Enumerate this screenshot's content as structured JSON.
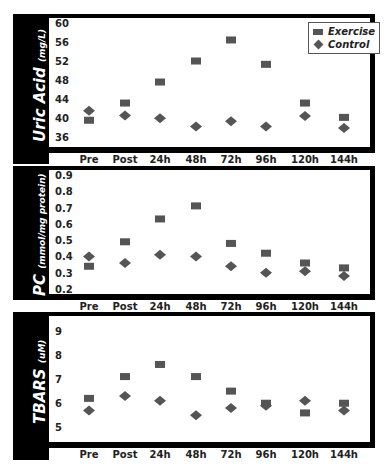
{
  "chart_data": [
    {
      "type": "scatter",
      "title": "",
      "ylabel": "Uric Acid",
      "ylabel_unit": "(mg/L)",
      "xlabel": "",
      "categories": [
        "Pre",
        "Post",
        "24h",
        "48h",
        "72h",
        "96h",
        "120h",
        "144h"
      ],
      "yticks": [
        60,
        56,
        52,
        48,
        44,
        40,
        36
      ],
      "ylim": [
        34,
        61
      ],
      "series": [
        {
          "name": "Exercise",
          "marker": "square",
          "values": [
            39.6,
            43.2,
            47.6,
            52.0,
            56.4,
            51.3,
            43.2,
            40.2
          ]
        },
        {
          "name": "Control",
          "marker": "diamond",
          "values": [
            41.6,
            40.6,
            40.0,
            38.3,
            39.4,
            38.3,
            40.5,
            38.0
          ]
        }
      ],
      "legend": {
        "position": "top-right",
        "entries": [
          "Exercise",
          "Control"
        ]
      },
      "grid": false
    },
    {
      "type": "scatter",
      "title": "",
      "ylabel": "PC",
      "ylabel_unit": "(mmol/mg protein)",
      "xlabel": "",
      "categories": [
        "Pre",
        "Post",
        "24h",
        "48h",
        "72h",
        "96h",
        "120h",
        "144h"
      ],
      "yticks": [
        0.9,
        0.8,
        0.7,
        0.6,
        0.5,
        0.4,
        0.3,
        0.2
      ],
      "ylim": [
        0.17,
        0.93
      ],
      "series": [
        {
          "name": "Exercise",
          "marker": "square",
          "values": [
            0.34,
            0.49,
            0.63,
            0.71,
            0.48,
            0.42,
            0.36,
            0.33
          ]
        },
        {
          "name": "Control",
          "marker": "diamond",
          "values": [
            0.4,
            0.36,
            0.41,
            0.4,
            0.34,
            0.3,
            0.31,
            0.28
          ]
        }
      ],
      "grid": false
    },
    {
      "type": "scatter",
      "title": "",
      "ylabel": "TBARS",
      "ylabel_unit": "(uM)",
      "xlabel": "",
      "categories": [
        "Pre",
        "Post",
        "24h",
        "48h",
        "72h",
        "96h",
        "120h",
        "144h"
      ],
      "yticks": [
        9,
        8,
        7,
        6,
        5
      ],
      "ylim": [
        4.4,
        9.6
      ],
      "series": [
        {
          "name": "Exercise",
          "marker": "square",
          "values": [
            6.2,
            7.1,
            7.6,
            7.1,
            6.5,
            6.0,
            5.6,
            6.0
          ]
        },
        {
          "name": "Control",
          "marker": "diamond",
          "values": [
            5.7,
            6.3,
            6.1,
            5.5,
            5.8,
            5.9,
            6.1,
            5.7
          ]
        }
      ],
      "grid": false
    }
  ],
  "legend": {
    "exercise_label": "Exercise",
    "control_label": "Control"
  },
  "colors": {
    "marker": "#555555",
    "frame": "#000000",
    "sidebar": "#000000"
  }
}
